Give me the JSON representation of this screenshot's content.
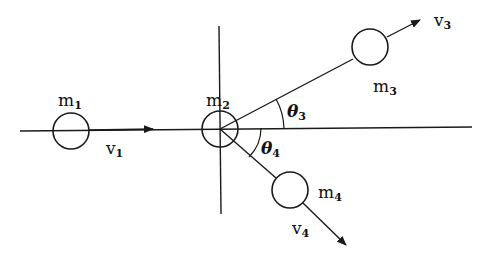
{
  "diagram": {
    "type": "two-body collision schematic",
    "colors": {
      "ink": "#1a1a1a",
      "background": "#ffffff"
    },
    "labels": {
      "m1": {
        "base": "m",
        "sub": "1"
      },
      "m2": {
        "base": "m",
        "sub": "2"
      },
      "m3": {
        "base": "m",
        "sub": "3"
      },
      "m4": {
        "base": "m",
        "sub": "4"
      },
      "v1": {
        "base": "v",
        "sub": "1"
      },
      "v3": {
        "base": "v",
        "sub": "3"
      },
      "v4": {
        "base": "v",
        "sub": "4"
      },
      "theta3": {
        "base": "θ",
        "sub": "3"
      },
      "theta4": {
        "base": "θ",
        "sub": "4"
      }
    }
  }
}
